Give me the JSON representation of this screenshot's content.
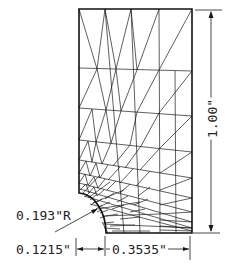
{
  "figure": {
    "colors": {
      "line": "#1a1a1a",
      "background": "#ffffff"
    }
  },
  "dimensions": {
    "height_label": "1.00\"",
    "radius_label": "0.193\"R",
    "left_width_label": "0.1215\"",
    "right_width_label": "0.3535\""
  },
  "geometry": {
    "outline": {
      "top_y": 9,
      "bottom_y": 233,
      "left_x": 79,
      "right_x": 192,
      "fillet_start": [
        79,
        193
      ],
      "fillet_end": [
        106,
        233
      ]
    }
  }
}
